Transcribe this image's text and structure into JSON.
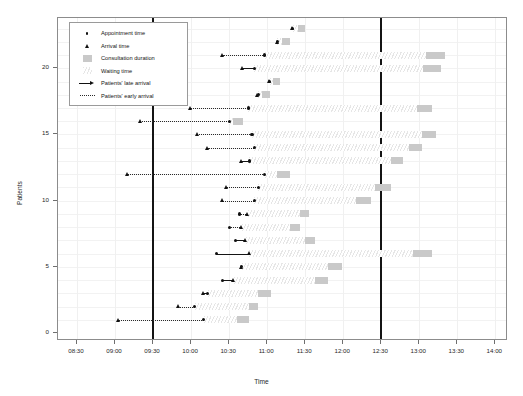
{
  "chart_data": {
    "type": "scatter",
    "title": "",
    "xlabel": "Time",
    "ylabel": "Patients",
    "xlim": [
      "08:15",
      "14:10"
    ],
    "ylim": [
      -0.6,
      23.8
    ],
    "grid": true,
    "legend_position": "top-left",
    "x_ticks": [
      "08:30",
      "09:00",
      "09:30",
      "10:00",
      "10:30",
      "11:00",
      "11:30",
      "12:00",
      "12:30",
      "13:00",
      "13:30",
      "14:00"
    ],
    "y_ticks": [
      "0",
      "5",
      "10",
      "15",
      "20"
    ],
    "session_lines": [
      "09:30",
      "12:30"
    ],
    "legend": [
      {
        "label": "Appointment time",
        "key": "dot"
      },
      {
        "label": "Arrival time",
        "key": "triangle"
      },
      {
        "label": "Consultation duration",
        "key": "gray-box"
      },
      {
        "label": "Waiting time",
        "key": "hatch-box"
      },
      {
        "label": "Patients' late arrival",
        "key": "arrow"
      },
      {
        "label": "Patients' early arrival",
        "key": "dotted"
      }
    ],
    "series": [
      {
        "name": "Appointment time",
        "marker": "dot",
        "color": "#111111"
      },
      {
        "name": "Arrival time",
        "marker": "triangle",
        "color": "#111111"
      },
      {
        "name": "Consultation duration",
        "marker": "bar",
        "color": "#c9c9c9"
      },
      {
        "name": "Waiting time",
        "marker": "hatch",
        "color": "#e6e6e6"
      }
    ],
    "patients": [
      {
        "patient": 1,
        "appointment": "10:10",
        "arrival": "09:03",
        "arrival_type": "early",
        "wait_start": "10:10",
        "consult_start": "10:36",
        "consult_end": "10:46"
      },
      {
        "patient": 2,
        "appointment": "10:03",
        "arrival": "09:50",
        "arrival_type": "early",
        "wait_start": "10:03",
        "consult_start": "10:46",
        "consult_end": "10:53"
      },
      {
        "patient": 3,
        "appointment": "10:13",
        "arrival": "10:10",
        "arrival_type": "late",
        "wait_start": "10:13",
        "consult_start": "10:53",
        "consult_end": "11:03"
      },
      {
        "patient": 4,
        "appointment": "10:25",
        "arrival": "10:34",
        "arrival_type": "late",
        "wait_start": "10:34",
        "consult_start": "11:38",
        "consult_end": "11:48"
      },
      {
        "patient": 5,
        "appointment": "10:40",
        "arrival": "10:40",
        "arrival_type": "on-time",
        "wait_start": "10:40",
        "consult_start": "11:48",
        "consult_end": "11:59"
      },
      {
        "patient": 6,
        "appointment": "10:20",
        "arrival": "10:46",
        "arrival_type": "late",
        "wait_start": "10:46",
        "consult_start": "12:55",
        "consult_end": "13:10"
      },
      {
        "patient": 7,
        "appointment": "10:35",
        "arrival": "10:43",
        "arrival_type": "late",
        "wait_start": "10:43",
        "consult_start": "11:30",
        "consult_end": "11:38"
      },
      {
        "patient": 8,
        "appointment": "10:30",
        "arrival": "10:40",
        "arrival_type": "early",
        "wait_start": "10:40",
        "consult_start": "11:18",
        "consult_end": "11:26"
      },
      {
        "patient": 9,
        "appointment": "10:38",
        "arrival": "10:45",
        "arrival_type": "early",
        "wait_start": "10:45",
        "consult_start": "11:26",
        "consult_end": "11:33"
      },
      {
        "patient": 10,
        "appointment": "10:50",
        "arrival": "10:25",
        "arrival_type": "early",
        "wait_start": "10:50",
        "consult_start": "12:10",
        "consult_end": "12:22"
      },
      {
        "patient": 11,
        "appointment": "10:53",
        "arrival": "10:28",
        "arrival_type": "early",
        "wait_start": "10:53",
        "consult_start": "12:25",
        "consult_end": "12:38"
      },
      {
        "patient": 12,
        "appointment": "10:58",
        "arrival": "09:10",
        "arrival_type": "early",
        "wait_start": "10:58",
        "consult_start": "11:08",
        "consult_end": "11:18"
      },
      {
        "patient": 13,
        "appointment": "10:46",
        "arrival": "10:40",
        "arrival_type": "late",
        "wait_start": "10:46",
        "consult_start": "12:38",
        "consult_end": "12:47"
      },
      {
        "patient": 14,
        "appointment": "10:50",
        "arrival": "10:13",
        "arrival_type": "early",
        "wait_start": "10:50",
        "consult_start": "12:52",
        "consult_end": "13:02"
      },
      {
        "patient": 15,
        "appointment": "10:48",
        "arrival": "10:05",
        "arrival_type": "early",
        "wait_start": "10:48",
        "consult_start": "13:02",
        "consult_end": "13:13"
      },
      {
        "patient": 16,
        "appointment": "10:30",
        "arrival": "09:20",
        "arrival_type": "early",
        "wait_start": "10:30",
        "consult_start": "10:33",
        "consult_end": "10:41"
      },
      {
        "patient": 17,
        "appointment": "10:45",
        "arrival": "10:00",
        "arrival_type": "early",
        "wait_start": "10:45",
        "consult_start": "12:58",
        "consult_end": "13:10"
      },
      {
        "patient": 18,
        "appointment": "10:53",
        "arrival": "10:53",
        "arrival_type": "on-time",
        "wait_start": "10:53",
        "consult_start": "10:56",
        "consult_end": "11:02"
      },
      {
        "patient": 19,
        "appointment": "11:02",
        "arrival": "11:02",
        "arrival_type": "on-time",
        "wait_start": "11:02",
        "consult_start": "11:05",
        "consult_end": "11:10"
      },
      {
        "patient": 20,
        "appointment": "10:50",
        "arrival": "10:41",
        "arrival_type": "late",
        "wait_start": "10:50",
        "consult_start": "13:03",
        "consult_end": "13:17"
      },
      {
        "patient": 21,
        "appointment": "10:58",
        "arrival": "10:25",
        "arrival_type": "early",
        "wait_start": "10:58",
        "consult_start": "13:05",
        "consult_end": "13:20"
      },
      {
        "patient": 22,
        "appointment": "11:08",
        "arrival": "11:08",
        "arrival_type": "on-time",
        "wait_start": "11:08",
        "consult_start": "11:12",
        "consult_end": "11:18"
      },
      {
        "patient": 23,
        "appointment": "11:20",
        "arrival": "11:20",
        "arrival_type": "on-time",
        "wait_start": "11:20",
        "consult_start": "11:24",
        "consult_end": "11:30"
      }
    ]
  }
}
